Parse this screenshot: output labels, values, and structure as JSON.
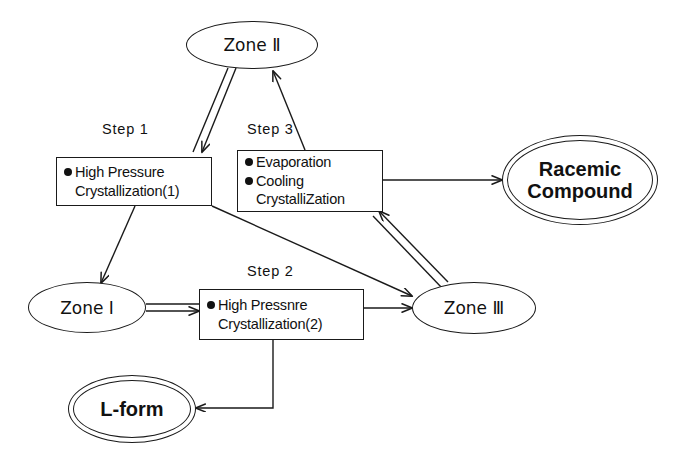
{
  "diagram": {
    "background_color": "#ffffff",
    "line_color": "#1a1a1a"
  },
  "nodes": {
    "zone2": {
      "label": "Zone Ⅱ",
      "shape": "ellipse"
    },
    "zone1": {
      "label": "Zone Ⅰ",
      "shape": "ellipse"
    },
    "zone3": {
      "label": "Zone Ⅲ",
      "shape": "ellipse"
    },
    "racemic": {
      "line1": "Racemic",
      "line2": "Compound",
      "shape": "double-ellipse"
    },
    "lform": {
      "label": "L-form",
      "shape": "double-ellipse"
    },
    "step1": {
      "caption": "Step 1",
      "line1": "High Pressure",
      "line2": "Crystallization(1)"
    },
    "step2": {
      "caption": "Step 2",
      "line1": "High Pressnre",
      "line2": "Crystallization(2)"
    },
    "step3": {
      "caption": "Step 3",
      "line1": "Evaporation",
      "line2": "Cooling",
      "line3": "CrystalliZation"
    }
  },
  "edges": [
    {
      "name": "zone2-to-step1",
      "from": "zone2",
      "to": "step1",
      "style": "double-line"
    },
    {
      "name": "step3-to-zone2",
      "from": "step3",
      "to": "zone2",
      "style": "single-line"
    },
    {
      "name": "step1-to-zone1",
      "from": "step1",
      "to": "zone1",
      "style": "single-line"
    },
    {
      "name": "step1-to-zone3",
      "from": "step1",
      "to": "zone3",
      "style": "single-line"
    },
    {
      "name": "step3-to-racemic",
      "from": "step3",
      "to": "racemic",
      "style": "single-line"
    },
    {
      "name": "zone3-to-step3",
      "from": "zone3",
      "to": "step3",
      "style": "double-line"
    },
    {
      "name": "zone1-to-step2",
      "from": "zone1",
      "to": "step2",
      "style": "double-line"
    },
    {
      "name": "step2-to-zone3",
      "from": "step2",
      "to": "zone3",
      "style": "single-line"
    },
    {
      "name": "step2-to-lform",
      "from": "step2",
      "to": "lform",
      "style": "single-line"
    }
  ]
}
